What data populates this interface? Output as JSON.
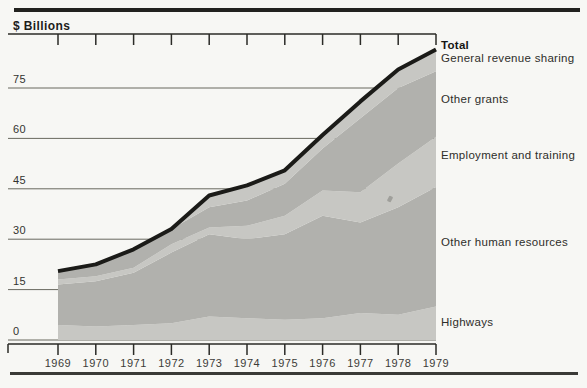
{
  "page": {
    "axis_title": "$ Billions"
  },
  "chart_data": {
    "type": "area",
    "stacked": true,
    "title": "$ Billions",
    "xlabel": "",
    "ylabel": "$ Billions",
    "x": [
      1969,
      1970,
      1971,
      1972,
      1973,
      1974,
      1975,
      1976,
      1977,
      1978,
      1979
    ],
    "y_ticks": [
      0,
      15,
      30,
      45,
      60,
      75
    ],
    "ylim": [
      0,
      91
    ],
    "grid": "horizontal",
    "legend_position": "right of plot, aligned to band centers",
    "series": [
      {
        "name": "Highways",
        "shade": "light",
        "values": [
          4.5,
          4.0,
          4.5,
          5.0,
          7.0,
          6.5,
          6.0,
          6.5,
          8.0,
          7.5,
          10.0
        ]
      },
      {
        "name": "Other human resources",
        "shade": "medium",
        "values": [
          12.0,
          13.5,
          15.5,
          21.0,
          24.5,
          23.5,
          25.5,
          30.5,
          27.0,
          32.0,
          35.5
        ]
      },
      {
        "name": "Employment and training",
        "shade": "light",
        "values": [
          1.5,
          1.5,
          1.5,
          2.5,
          2.0,
          4.0,
          5.5,
          7.5,
          9.0,
          13.0,
          15.0
        ]
      },
      {
        "name": "Other grants",
        "shade": "medium",
        "values": [
          2.5,
          3.5,
          5.5,
          4.5,
          6.0,
          7.5,
          9.5,
          12.5,
          22.0,
          22.5,
          19.5
        ]
      },
      {
        "name": "General revenue sharing",
        "shade": "light",
        "values": [
          0,
          0,
          0,
          0,
          3.5,
          4.5,
          4.0,
          4.0,
          5.0,
          5.5,
          6.5
        ]
      }
    ],
    "total_series": {
      "name": "Total",
      "values": [
        20.5,
        22.5,
        27.0,
        33.0,
        43.0,
        46.0,
        50.5,
        61.0,
        71.0,
        80.5,
        86.5
      ]
    },
    "colors": {
      "band_light": "#c7c7c3",
      "band_medium": "#b1b1ad",
      "total_line": "#1b1b18",
      "grid": "#68685f",
      "axis": "#2b2b27"
    }
  }
}
